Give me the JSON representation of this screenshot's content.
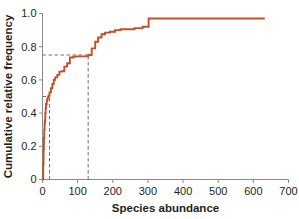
{
  "chart_data": {
    "type": "line",
    "subtype": "step-ecdf",
    "title": "",
    "subtitle": "",
    "xlabel": "Species abundance",
    "ylabel": "Cumulative relative frequency",
    "xlim": [
      0,
      700
    ],
    "ylim": [
      0,
      1.0
    ],
    "xticks": [
      0,
      100,
      200,
      300,
      400,
      500,
      600,
      700
    ],
    "xtick_labels": [
      "0",
      "100",
      "200",
      "300",
      "400",
      "500",
      "600",
      "700"
    ],
    "yticks": [
      0,
      0.2,
      0.4,
      0.6,
      0.8,
      1.0
    ],
    "ytick_labels": [
      "0",
      "0.2",
      "0.4",
      "0.6",
      "0.8",
      "1.0"
    ],
    "grid": false,
    "legend": null,
    "legend_position": "none",
    "series_color": "#c0502a",
    "series": [
      {
        "name": "Cumulative relative frequency",
        "step_mode": "post",
        "x": [
          1,
          2,
          3,
          4,
          5,
          6,
          7,
          8,
          9,
          10,
          12,
          14,
          16,
          18,
          20,
          24,
          28,
          32,
          36,
          42,
          48,
          55,
          62,
          70,
          78,
          88,
          98,
          110,
          122,
          130,
          140,
          150,
          158,
          168,
          178,
          192,
          206,
          222,
          240,
          262,
          285,
          302,
          630
        ],
        "y": [
          0.0,
          0.09,
          0.18,
          0.25,
          0.3,
          0.34,
          0.355,
          0.4,
          0.43,
          0.455,
          0.475,
          0.49,
          0.5,
          0.505,
          0.525,
          0.55,
          0.575,
          0.6,
          0.615,
          0.63,
          0.65,
          0.652,
          0.68,
          0.7,
          0.735,
          0.74,
          0.742,
          0.742,
          0.742,
          0.75,
          0.79,
          0.83,
          0.855,
          0.875,
          0.885,
          0.89,
          0.9,
          0.905,
          0.905,
          0.912,
          0.92,
          0.97,
          0.975
        ]
      }
    ],
    "reference_lines": [
      {
        "name": "median-horizontal",
        "orientation": "horizontal",
        "value": 0.5,
        "x_from": 0,
        "x_to": 20,
        "style": "dashed"
      },
      {
        "name": "median-vertical",
        "orientation": "vertical",
        "value": 20,
        "y_from": 0,
        "y_to": 0.5,
        "style": "dashed"
      },
      {
        "name": "upper-quartile-horizontal",
        "orientation": "horizontal",
        "value": 0.75,
        "x_from": 0,
        "x_to": 130,
        "style": "dashed"
      },
      {
        "name": "upper-quartile-vertical",
        "orientation": "vertical",
        "value": 130,
        "y_from": 0,
        "y_to": 0.75,
        "style": "dashed"
      }
    ]
  },
  "axes": {
    "x_title": "Species abundance",
    "y_title": "Cumulative relative frequency"
  },
  "colors": {
    "series": "#c0502a",
    "axis": "#8a8a8a",
    "text": "#231f20",
    "reference": "#6f6f6f",
    "background": "#ffffff"
  }
}
